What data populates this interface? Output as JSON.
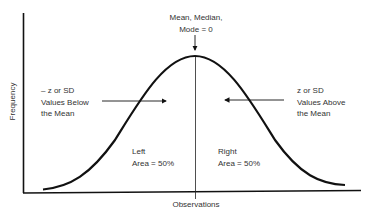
{
  "diagram": {
    "y_axis_label": "Frequency",
    "x_axis_label": "Observations",
    "center_label": {
      "line1": "Mean, Median,",
      "line2": "Mode = 0"
    },
    "left_callout": {
      "line1": "– z or SD",
      "line2": "Values Below",
      "line3": "the Mean"
    },
    "right_callout": {
      "line1": "z or SD",
      "line2": "Values Above",
      "line3": "the Mean"
    },
    "left_area": {
      "line1": "Left",
      "line2": "Area = 50%"
    },
    "right_area": {
      "line1": "Right",
      "line2": "Area = 50%"
    },
    "colors": {
      "line": "#111111",
      "text": "#333333",
      "background": "#ffffff"
    }
  }
}
